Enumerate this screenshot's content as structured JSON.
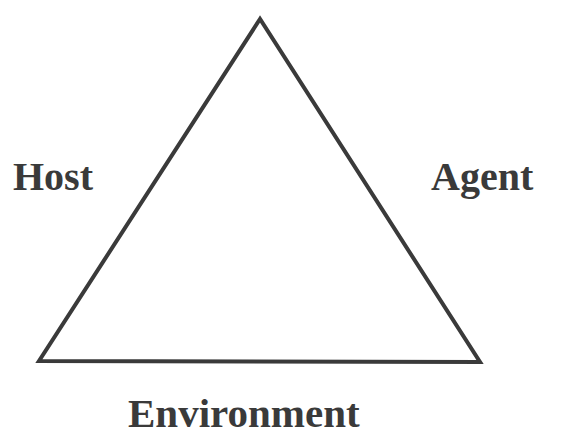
{
  "diagram": {
    "shape": "triangle",
    "vertices_labels": {
      "left": "Host",
      "right": "Agent",
      "bottom": "Environment"
    },
    "colors": {
      "line": "#3a3a3a",
      "text": "#3a3a3a",
      "background": "#ffffff"
    }
  }
}
